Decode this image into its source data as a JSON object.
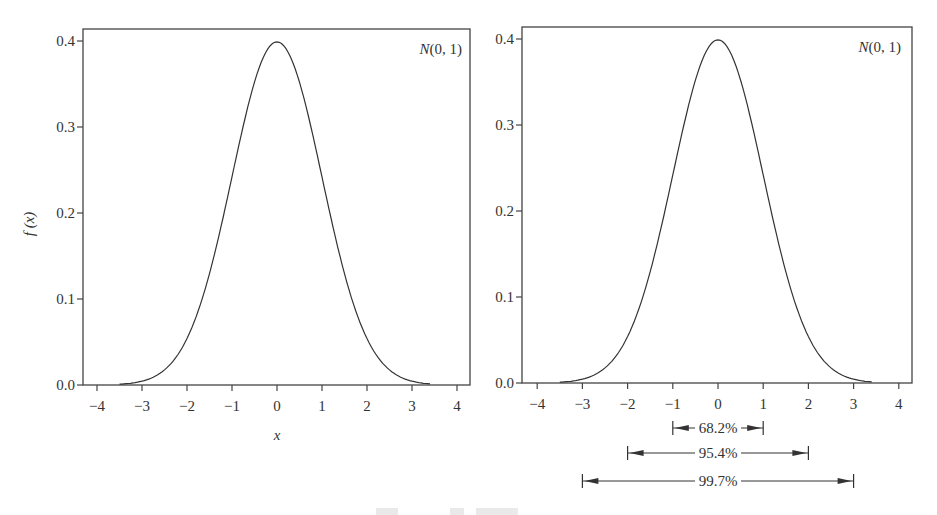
{
  "figure": {
    "caption_visible": false
  },
  "chart_data": [
    {
      "type": "line",
      "title": "",
      "annotation": "N(0, 1)",
      "xlabel": "x",
      "ylabel": "f (x)",
      "xlim": [
        -4.3,
        4.3
      ],
      "ylim": [
        0.0,
        0.41
      ],
      "xticks": [
        -4,
        -3,
        -2,
        -1,
        0,
        1,
        2,
        3,
        4
      ],
      "xtick_labels": [
        "−4",
        "−3",
        "−2",
        "−1",
        "0",
        "1",
        "2",
        "3",
        "4"
      ],
      "yticks": [
        0.0,
        0.1,
        0.2,
        0.3,
        0.4
      ],
      "ytick_labels": [
        "0.0",
        "0.1",
        "0.2",
        "0.3",
        "0.4"
      ],
      "grid": false,
      "legend": null,
      "series": [
        {
          "name": "standard normal pdf",
          "x": [
            -3.5,
            -3.0,
            -2.5,
            -2.0,
            -1.5,
            -1.0,
            -0.5,
            0.0,
            0.5,
            1.0,
            1.5,
            2.0,
            2.5,
            3.0,
            3.5
          ],
          "y": [
            0.0009,
            0.0044,
            0.0175,
            0.054,
            0.1295,
            0.242,
            0.3521,
            0.3989,
            0.3521,
            0.242,
            0.1295,
            0.054,
            0.0175,
            0.0044,
            0.0009
          ]
        }
      ]
    },
    {
      "type": "line",
      "title": "",
      "annotation": "N(0, 1)",
      "xlabel": "",
      "ylabel": "",
      "xlim": [
        -4.3,
        4.3
      ],
      "ylim": [
        0.0,
        0.41
      ],
      "xticks": [
        -4,
        -3,
        -2,
        -1,
        0,
        1,
        2,
        3,
        4
      ],
      "xtick_labels": [
        "−4",
        "−3",
        "−2",
        "−1",
        "0",
        "1",
        "2",
        "3",
        "4"
      ],
      "yticks": [
        0.0,
        0.1,
        0.2,
        0.3,
        0.4
      ],
      "ytick_labels": [
        "0.0",
        "0.1",
        "0.2",
        "0.3",
        "0.4"
      ],
      "grid": false,
      "legend": null,
      "series": [
        {
          "name": "standard normal pdf",
          "x": [
            -3.5,
            -3.0,
            -2.5,
            -2.0,
            -1.5,
            -1.0,
            -0.5,
            0.0,
            0.5,
            1.0,
            1.5,
            2.0,
            2.5,
            3.0,
            3.5
          ],
          "y": [
            0.0009,
            0.0044,
            0.0175,
            0.054,
            0.1295,
            0.242,
            0.3521,
            0.3989,
            0.3521,
            0.242,
            0.1295,
            0.054,
            0.0175,
            0.0044,
            0.0009
          ]
        }
      ],
      "intervals": [
        {
          "from": -1,
          "to": 1,
          "label": "68.2%"
        },
        {
          "from": -2,
          "to": 2,
          "label": "95.4%"
        },
        {
          "from": -3,
          "to": 3,
          "label": "99.7%"
        }
      ]
    }
  ]
}
